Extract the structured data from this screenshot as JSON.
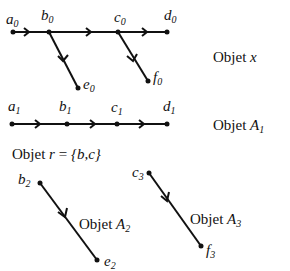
{
  "diagram": {
    "objects": [
      {
        "caption_prefix": "Objet",
        "caption_var": "x",
        "vertices": [
          {
            "id": "a",
            "sub": "0"
          },
          {
            "id": "b",
            "sub": "0"
          },
          {
            "id": "c",
            "sub": "0"
          },
          {
            "id": "d",
            "sub": "0"
          },
          {
            "id": "e",
            "sub": "0"
          },
          {
            "id": "f",
            "sub": "0"
          }
        ],
        "edges": [
          [
            "a0",
            "b0"
          ],
          [
            "b0",
            "c0"
          ],
          [
            "c0",
            "d0"
          ],
          [
            "b0",
            "e0"
          ],
          [
            "c0",
            "f0"
          ]
        ]
      },
      {
        "caption_prefix": "Objet",
        "caption_var": "A",
        "caption_sub": "1",
        "vertices": [
          {
            "id": "a",
            "sub": "1"
          },
          {
            "id": "b",
            "sub": "1"
          },
          {
            "id": "c",
            "sub": "1"
          },
          {
            "id": "d",
            "sub": "1"
          }
        ],
        "edges": [
          [
            "a1",
            "b1"
          ],
          [
            "b1",
            "c1"
          ],
          [
            "c1",
            "d1"
          ]
        ]
      },
      {
        "caption_prefix": "Objet",
        "caption_var": "A",
        "caption_sub": "2",
        "vertices": [
          {
            "id": "b",
            "sub": "2"
          },
          {
            "id": "e",
            "sub": "2"
          }
        ],
        "edges": [
          [
            "b2",
            "e2"
          ]
        ]
      },
      {
        "caption_prefix": "Objet",
        "caption_var": "A",
        "caption_sub": "3",
        "vertices": [
          {
            "id": "c",
            "sub": "3"
          },
          {
            "id": "f",
            "sub": "3"
          }
        ],
        "edges": [
          [
            "c3",
            "f3"
          ]
        ]
      }
    ],
    "r_caption": {
      "prefix": "Objet",
      "var": "r",
      "equals": "=",
      "set": "{b,c}"
    }
  }
}
